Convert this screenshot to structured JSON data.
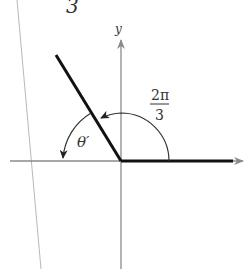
{
  "figure": {
    "type": "angle-diagram",
    "top_fragment": "3",
    "axis_label_y": "y",
    "angle_label": {
      "numerator": "2π",
      "denominator": "3"
    },
    "reference_angle_label": "θ′",
    "colors": {
      "axis": "#8a8a8a",
      "ray": "#111111",
      "arc": "#333333",
      "margin_line": "#b5b5b5"
    }
  }
}
